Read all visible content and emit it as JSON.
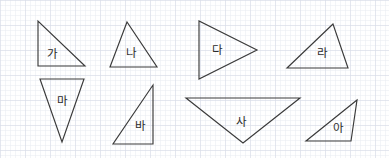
{
  "worksheet": {
    "title": "Triangles on Grid Paper",
    "width": 389,
    "height": 158,
    "background_color": "#ffffff",
    "stroke_color": "#3a3a3a",
    "label_color": "#2b2b2b",
    "grid": {
      "minor_spacing": 5,
      "major_spacing": 25,
      "minor_color": "#e9ecf2",
      "major_color": "#d8dde8",
      "visible": true
    }
  },
  "figures": [
    {
      "id": "triangle-ga",
      "label": "가",
      "shape": "right-triangle",
      "orientation": "right-angle-bottom-left",
      "points": "38,21 38,66 85,66",
      "label_x": 52,
      "label_y": 54
    },
    {
      "id": "triangle-na",
      "label": "나",
      "shape": "isosceles-triangle",
      "orientation": "apex-up",
      "points": "127,22 110,67 157,67",
      "label_x": 131,
      "label_y": 53
    },
    {
      "id": "triangle-da",
      "label": "다",
      "shape": "isosceles-triangle",
      "orientation": "apex-right",
      "points": "199,21 199,79 257,50",
      "label_x": 217,
      "label_y": 50
    },
    {
      "id": "triangle-ra",
      "label": "라",
      "shape": "scalene-triangle",
      "orientation": "apex-up-right",
      "points": "333,24 287,68 348,68",
      "label_x": 322,
      "label_y": 53
    },
    {
      "id": "triangle-ma",
      "label": "마",
      "shape": "isosceles-triangle",
      "orientation": "apex-down",
      "points": "40,79 84,79 62,142",
      "label_x": 62,
      "label_y": 101
    },
    {
      "id": "triangle-ba",
      "label": "바",
      "shape": "right-triangle",
      "orientation": "right-angle-bottom-right",
      "points": "153,85 153,144 113,144",
      "label_x": 140,
      "label_y": 126
    },
    {
      "id": "triangle-sa",
      "label": "사",
      "shape": "isosceles-triangle",
      "orientation": "apex-down-wide",
      "points": "186,98 300,98 243,143",
      "label_x": 241,
      "label_y": 122
    },
    {
      "id": "triangle-a",
      "label": "아",
      "shape": "obtuse-scalene-triangle",
      "orientation": "apex-up-right",
      "points": "357,100 306,141 351,141",
      "label_x": 338,
      "label_y": 128
    }
  ]
}
